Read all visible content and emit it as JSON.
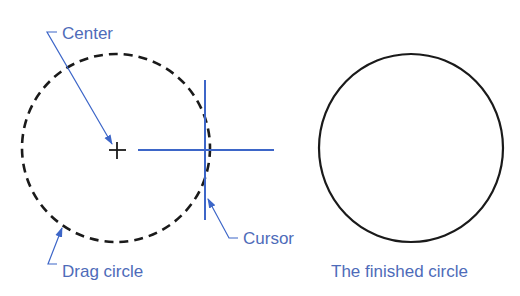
{
  "colors": {
    "annotation_blue": "#4e6bb9",
    "cursor_blue": "#3d66c8",
    "circle_black": "#1a1a1a",
    "background": "#ffffff"
  },
  "labels": {
    "center": "Center",
    "cursor": "Cursor",
    "drag_circle": "Drag circle",
    "finished_circle": "The finished circle"
  },
  "drag_circle": {
    "center": [
      116,
      148
    ],
    "radius": 94,
    "style": "dashed"
  },
  "center_mark": {
    "symbol": "+",
    "position": [
      117,
      150
    ]
  },
  "cursor_crosshair": {
    "vertical": {
      "x": 205,
      "y1": 80,
      "y2": 220
    },
    "horizontal": {
      "y": 150,
      "x1": 138,
      "x2": 274
    }
  },
  "finished_circle": {
    "center": [
      411,
      148
    ],
    "radius": 93,
    "style": "solid"
  }
}
